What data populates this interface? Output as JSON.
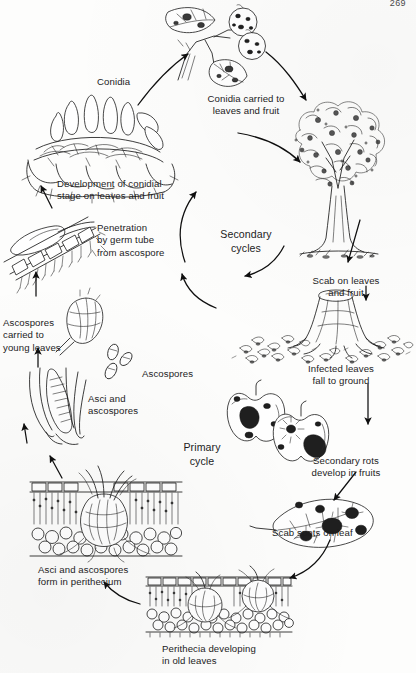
{
  "document": {
    "page_number": "269",
    "diagram_title": "Apple scab disease cycle",
    "background_color": "#fdfdfc",
    "ink_color": "#1b1b1b"
  },
  "cycle_labels": {
    "secondary": "Secondary\ncycles",
    "primary": "Primary\ncycle"
  },
  "stages": [
    {
      "id": "conidia",
      "label": "Conidia",
      "x": 97,
      "y": 76,
      "align": "left"
    },
    {
      "id": "conidia-carried",
      "label": "Conidia carried to\nleaves and fruit",
      "x": 184,
      "y": 93,
      "align": "center"
    },
    {
      "id": "conidial-stage",
      "label": "Development of conidial\nstage on leaves and fruit",
      "x": 57,
      "y": 178,
      "align": "left"
    },
    {
      "id": "penetration",
      "label": "Penetration\nby germ tube\nfrom ascospore",
      "x": 97,
      "y": 222,
      "align": "left"
    },
    {
      "id": "ascospores-carried",
      "label": "Ascospores\ncarried to\nyoung leaves",
      "x": 3,
      "y": 317,
      "align": "left"
    },
    {
      "id": "ascospores-free",
      "label": "Ascospores",
      "x": 142,
      "y": 368,
      "align": "left"
    },
    {
      "id": "asci-ascospores",
      "label": "Asci and\nascospores",
      "x": 88,
      "y": 393,
      "align": "left"
    },
    {
      "id": "perithecium-form",
      "label": "Asci and ascospores\nform in perithecium",
      "x": 38,
      "y": 564,
      "align": "left"
    },
    {
      "id": "perithecia-dev",
      "label": "Perithecia developing\nin old leaves",
      "x": 162,
      "y": 643,
      "align": "left"
    },
    {
      "id": "scab-spots",
      "label": "Scab spots on leaf",
      "x": 272,
      "y": 527,
      "align": "left"
    },
    {
      "id": "secondary-rots",
      "label": "Secondary rots\ndevelop in fruits",
      "x": 330,
      "y": 455,
      "align": "center"
    },
    {
      "id": "infected-leaves",
      "label": "Infected leaves\nfall to ground",
      "x": 331,
      "y": 363,
      "align": "center"
    },
    {
      "id": "scab-on-tree",
      "label": "Scab on leaves\nand fruit",
      "x": 339,
      "y": 275,
      "align": "center"
    }
  ],
  "illustrations": [
    {
      "id": "infected-shoot-icon",
      "name": "branch-with-scabbed-leaves-and-fruit"
    },
    {
      "id": "conidiophore-icon",
      "name": "conidiophore-cross-section"
    },
    {
      "id": "germ-tube-icon",
      "name": "germ-tube-penetrating-leaf-cuticle"
    },
    {
      "id": "ascospore-discharge-icon",
      "name": "ascospore-discharge-bud"
    },
    {
      "id": "free-ascospores-icon",
      "name": "free-ascospores"
    },
    {
      "id": "ascus-icon",
      "name": "asci-with-ascospores"
    },
    {
      "id": "perithecium-icon",
      "name": "perithecium-in-leaf-cross-section"
    },
    {
      "id": "perithecia-leaf-icon",
      "name": "perithecia-developing-in-old-leaf"
    },
    {
      "id": "scabbed-leaf-icon",
      "name": "leaf-with-scab-spots"
    },
    {
      "id": "rotted-apples-icon",
      "name": "apples-with-secondary-rot"
    },
    {
      "id": "stump-leaves-icon",
      "name": "fallen-infected-leaves-on-ground"
    },
    {
      "id": "apple-tree-icon",
      "name": "apple-tree-with-scab"
    }
  ]
}
